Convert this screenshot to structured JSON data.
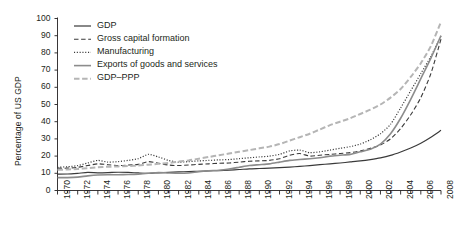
{
  "chart_data": {
    "type": "line",
    "title": "",
    "xlabel": "",
    "ylabel": "Percentage of US GDP",
    "xlim": [
      1970,
      2008
    ],
    "ylim": [
      0,
      100
    ],
    "grid": false,
    "legend_position": "top-left-inside",
    "x": [
      1970,
      1971,
      1972,
      1973,
      1974,
      1975,
      1976,
      1977,
      1978,
      1979,
      1980,
      1981,
      1982,
      1983,
      1984,
      1985,
      1986,
      1987,
      1988,
      1989,
      1990,
      1991,
      1992,
      1993,
      1994,
      1995,
      1996,
      1997,
      1998,
      1999,
      2000,
      2001,
      2002,
      2003,
      2004,
      2005,
      2006,
      2007,
      2008
    ],
    "xtick_labels": [
      "1970",
      "1972",
      "1974",
      "1976",
      "1978",
      "1980",
      "1982",
      "1984",
      "1986",
      "1988",
      "1990",
      "1992",
      "1994",
      "1996",
      "1998",
      "2000",
      "2002",
      "2004",
      "2006",
      "2008"
    ],
    "ytick_labels": [
      "0",
      "10",
      "20",
      "30",
      "40",
      "50",
      "60",
      "70",
      "80",
      "90",
      "100"
    ],
    "series": [
      {
        "name": "GDP",
        "style": "solid",
        "color": "#3a3a3a",
        "width": 1.2,
        "values": [
          9.5,
          9.6,
          10.0,
          10.5,
          10.3,
          10.4,
          10.6,
          10.5,
          10.2,
          10.0,
          10.3,
          10.5,
          10.8,
          11.0,
          11.2,
          11.4,
          11.6,
          11.9,
          12.2,
          12.6,
          12.8,
          13.0,
          13.3,
          13.6,
          14.0,
          14.5,
          15.0,
          15.5,
          16.0,
          16.6,
          17.2,
          18.0,
          19.0,
          20.4,
          22.4,
          24.7,
          27.5,
          31.0,
          35.0
        ]
      },
      {
        "name": "Gross capital formation",
        "style": "dashed",
        "color": "#3a3a3a",
        "width": 1.1,
        "values": [
          13.0,
          13.0,
          13.5,
          14.5,
          15.5,
          15.0,
          14.5,
          14.8,
          15.2,
          16.8,
          15.8,
          14.8,
          14.5,
          14.8,
          15.2,
          15.5,
          15.8,
          16.0,
          16.5,
          17.0,
          17.2,
          17.5,
          18.5,
          20.5,
          21.5,
          20.0,
          20.5,
          21.0,
          21.5,
          22.0,
          23.0,
          24.5,
          26.5,
          30.0,
          36.0,
          44.0,
          54.0,
          68.0,
          88.0
        ]
      },
      {
        "name": "Manufacturing",
        "style": "dotted",
        "color": "#3a3a3a",
        "width": 1.2,
        "values": [
          13.5,
          13.8,
          14.5,
          16.0,
          17.5,
          16.5,
          16.8,
          17.5,
          18.5,
          21.0,
          19.5,
          17.5,
          16.5,
          16.8,
          17.2,
          17.5,
          17.8,
          18.0,
          18.5,
          19.0,
          19.5,
          20.0,
          21.0,
          23.0,
          23.5,
          22.0,
          22.5,
          23.5,
          24.5,
          25.5,
          27.0,
          29.5,
          33.0,
          38.5,
          48.0,
          58.0,
          68.0,
          78.0,
          90.0
        ]
      },
      {
        "name": "Exports of goods and services",
        "style": "solid",
        "color": "#8c8c8c",
        "width": 1.6,
        "values": [
          7.5,
          7.5,
          7.8,
          8.5,
          9.0,
          9.2,
          9.2,
          9.3,
          9.5,
          10.0,
          10.5,
          10.2,
          10.0,
          10.2,
          11.0,
          11.5,
          11.8,
          12.5,
          13.5,
          14.5,
          15.0,
          15.5,
          16.5,
          17.5,
          18.0,
          18.5,
          19.0,
          20.0,
          20.5,
          21.0,
          22.5,
          24.0,
          27.0,
          33.0,
          42.0,
          53.0,
          65.0,
          77.0,
          90.0
        ]
      },
      {
        "name": "GDP–PPP",
        "style": "dashdot",
        "color": "#b5b5b5",
        "width": 2.0,
        "values": [
          12.0,
          12.2,
          12.5,
          13.0,
          13.5,
          13.8,
          14.0,
          14.2,
          14.5,
          15.0,
          15.5,
          16.0,
          16.8,
          17.5,
          18.5,
          19.5,
          20.5,
          21.5,
          22.5,
          23.5,
          24.5,
          25.5,
          27.0,
          29.0,
          31.0,
          33.0,
          35.5,
          38.0,
          40.0,
          42.0,
          44.5,
          47.0,
          50.0,
          54.0,
          59.0,
          66.0,
          74.0,
          84.0,
          98.0
        ]
      }
    ]
  },
  "legend": {
    "entries": [
      {
        "label": "GDP"
      },
      {
        "label": "Gross capital formation"
      },
      {
        "label": "Manufacturing"
      },
      {
        "label": "Exports of goods and services"
      },
      {
        "label": "GDP–PPP"
      }
    ]
  }
}
